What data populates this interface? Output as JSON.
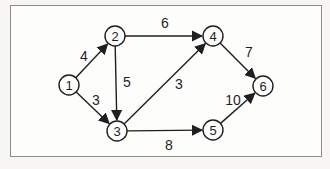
{
  "figure": {
    "type": "directed-graph",
    "canvas": {
      "width": 330,
      "height": 169
    },
    "outer_background": "#f7f6f3",
    "frame": {
      "x": 10,
      "y": 5,
      "width": 312,
      "height": 152,
      "border_color": "#8c8c8c",
      "fill": "#fdfdfc"
    },
    "ink_color": "#1f1f1f",
    "node_fill": "#fdfdfc",
    "node_radius": 10,
    "nodes": [
      {
        "id": "1",
        "label": "1",
        "x": 69,
        "y": 85
      },
      {
        "id": "2",
        "label": "2",
        "x": 115,
        "y": 36
      },
      {
        "id": "3",
        "label": "3",
        "x": 117,
        "y": 131
      },
      {
        "id": "4",
        "label": "4",
        "x": 213,
        "y": 36
      },
      {
        "id": "5",
        "label": "5",
        "x": 213,
        "y": 130
      },
      {
        "id": "6",
        "label": "6",
        "x": 263,
        "y": 86
      }
    ],
    "edges": [
      {
        "from": "1",
        "to": "2",
        "weight": "4",
        "label_x": 84,
        "label_y": 61
      },
      {
        "from": "1",
        "to": "3",
        "weight": "3",
        "label_x": 96,
        "label_y": 105
      },
      {
        "from": "2",
        "to": "4",
        "weight": "6",
        "label_x": 165,
        "label_y": 28
      },
      {
        "from": "2",
        "to": "3",
        "weight": "5",
        "label_x": 127,
        "label_y": 87
      },
      {
        "from": "3",
        "to": "4",
        "weight": "3",
        "label_x": 179,
        "label_y": 89
      },
      {
        "from": "3",
        "to": "5",
        "weight": "8",
        "label_x": 169,
        "label_y": 150
      },
      {
        "from": "4",
        "to": "6",
        "weight": "7",
        "label_x": 249,
        "label_y": 57
      },
      {
        "from": "5",
        "to": "6",
        "weight": "10",
        "label_x": 233,
        "label_y": 105
      }
    ]
  }
}
